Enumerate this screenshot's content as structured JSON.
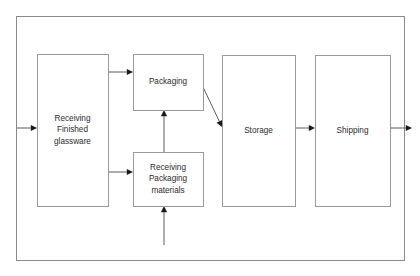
{
  "diagram": {
    "canvas": {
      "width": 420,
      "height": 276
    },
    "frame": {
      "x": 16,
      "y": 16,
      "width": 388,
      "height": 244
    },
    "colors": {
      "background": "#ffffff",
      "frame_stroke": "#8a8a8a",
      "node_stroke": "#9a9a9a",
      "node_fill": "#ffffff",
      "edge_stroke": "#5a5a5a",
      "arrowhead": "#1a1a1a",
      "text": "#2b2b2b"
    },
    "nodes": [
      {
        "id": "receiving-finished-glassware",
        "name": "receiving-finished-glassware-node",
        "lines": [
          "Receiving",
          "Finished",
          "glassware"
        ],
        "x": 37,
        "y": 54,
        "width": 71,
        "height": 152
      },
      {
        "id": "packaging",
        "name": "packaging-node",
        "lines": [
          "Packaging"
        ],
        "x": 133,
        "y": 54,
        "width": 70,
        "height": 56
      },
      {
        "id": "receiving-packaging-materials",
        "name": "receiving-packaging-materials-node",
        "lines": [
          "Receiving",
          "Packaging",
          "materials"
        ],
        "x": 133,
        "y": 152,
        "width": 70,
        "height": 54
      },
      {
        "id": "storage",
        "name": "storage-node",
        "lines": [
          "Storage"
        ],
        "x": 222,
        "y": 55,
        "width": 73,
        "height": 151
      },
      {
        "id": "shipping",
        "name": "shipping-node",
        "lines": [
          "Shipping"
        ],
        "x": 315,
        "y": 55,
        "width": 75,
        "height": 151
      }
    ],
    "edges": [
      {
        "id": "input-to-receiving",
        "name": "edge-input-to-receiving-finished-glassware",
        "from": "external-input",
        "to": "receiving-finished-glassware",
        "points": [
          [
            17,
            128
          ],
          [
            37,
            128
          ]
        ]
      },
      {
        "id": "receiving-to-packaging",
        "name": "edge-receiving-finished-glassware-to-packaging",
        "from": "receiving-finished-glassware",
        "to": "packaging",
        "points": [
          [
            108,
            72
          ],
          [
            133,
            72
          ]
        ]
      },
      {
        "id": "receiving-to-materials",
        "name": "edge-receiving-finished-glassware-to-receiving-packaging-materials",
        "from": "receiving-finished-glassware",
        "to": "receiving-packaging-materials",
        "points": [
          [
            108,
            172
          ],
          [
            133,
            172
          ]
        ]
      },
      {
        "id": "materials-to-packaging",
        "name": "edge-receiving-packaging-materials-to-packaging",
        "from": "receiving-packaging-materials",
        "to": "packaging",
        "points": [
          [
            164,
            152
          ],
          [
            164,
            110
          ]
        ]
      },
      {
        "id": "input-to-materials",
        "name": "edge-input-to-receiving-packaging-materials",
        "from": "external-input",
        "to": "receiving-packaging-materials",
        "points": [
          [
            164,
            245
          ],
          [
            164,
            206
          ]
        ]
      },
      {
        "id": "packaging-to-storage",
        "name": "edge-packaging-to-storage",
        "from": "packaging",
        "to": "storage",
        "points": [
          [
            203,
            87
          ],
          [
            222,
            127
          ]
        ]
      },
      {
        "id": "storage-to-shipping",
        "name": "edge-storage-to-shipping",
        "from": "storage",
        "to": "shipping",
        "points": [
          [
            295,
            128
          ],
          [
            315,
            128
          ]
        ]
      },
      {
        "id": "shipping-to-output",
        "name": "edge-shipping-to-external-output",
        "from": "shipping",
        "to": "external-output",
        "points": [
          [
            390,
            128
          ],
          [
            412,
            128
          ]
        ]
      }
    ]
  }
}
